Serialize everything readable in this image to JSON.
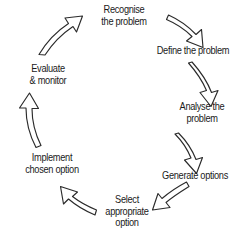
{
  "diagram": {
    "type": "cycle",
    "background_color": "#ffffff",
    "line_color": "#2b2b2b",
    "text_color": "#1a1a1a",
    "arrow_style": "hollow-outlined-block-arrow",
    "flow_direction": "clockwise",
    "stage_count": 7,
    "stages": [
      {
        "id": "recognise",
        "order": 1,
        "label": "Recognise\nthe problem",
        "position": "top"
      },
      {
        "id": "define",
        "order": 2,
        "label": "Define the problem",
        "position": "upper-right"
      },
      {
        "id": "analyse",
        "order": 3,
        "label": "Analyse the\nproblem",
        "position": "right"
      },
      {
        "id": "generate",
        "order": 4,
        "label": "Generate options",
        "position": "lower-right"
      },
      {
        "id": "select",
        "order": 5,
        "label": "Select\nappropriate\noption",
        "position": "bottom"
      },
      {
        "id": "implement",
        "order": 6,
        "label": "Implement\nchosen option",
        "position": "lower-left"
      },
      {
        "id": "evaluate",
        "order": 7,
        "label": "Evaluate\n& monitor",
        "position": "upper-left"
      }
    ],
    "connectors": [
      {
        "id": "recognise-to-define",
        "from": "recognise",
        "to": "define"
      },
      {
        "id": "define-to-analyse",
        "from": "define",
        "to": "analyse"
      },
      {
        "id": "analyse-to-generate",
        "from": "analyse",
        "to": "generate"
      },
      {
        "id": "generate-to-select",
        "from": "generate",
        "to": "select"
      },
      {
        "id": "select-to-implement",
        "from": "select",
        "to": "implement"
      },
      {
        "id": "implement-to-evaluate",
        "from": "implement",
        "to": "evaluate"
      },
      {
        "id": "evaluate-to-recognise",
        "from": "evaluate",
        "to": "recognise"
      }
    ]
  }
}
